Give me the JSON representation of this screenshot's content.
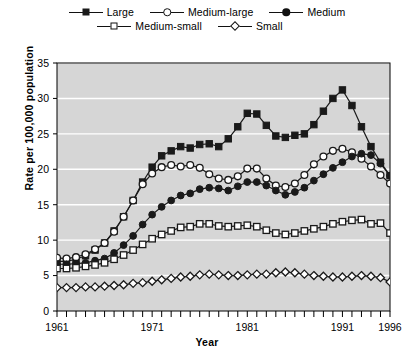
{
  "chart_data": {
    "type": "line",
    "title": "",
    "xlabel": "Year",
    "ylabel": "Rate per 100,000 population",
    "xlim": [
      1961,
      1996
    ],
    "ylim": [
      0,
      35
    ],
    "ytick_step": 5,
    "yticks": [
      0,
      5,
      10,
      15,
      20,
      25,
      30,
      35
    ],
    "xticks": [
      1961,
      1962,
      1963,
      1964,
      1965,
      1966,
      1967,
      1968,
      1969,
      1970,
      1971,
      1972,
      1973,
      1974,
      1975,
      1976,
      1977,
      1978,
      1979,
      1980,
      1981,
      1982,
      1983,
      1984,
      1985,
      1986,
      1987,
      1988,
      1989,
      1990,
      1991,
      1992,
      1993,
      1994,
      1995,
      1996
    ],
    "xtick_labels": [
      "1961",
      "1971",
      "1981",
      "1991",
      "1996"
    ],
    "xtick_label_values": [
      1961,
      1971,
      1981,
      1991,
      1996
    ],
    "grid": "horizontal-white",
    "plot_background": "#d6d6d6",
    "legend_position": "top",
    "x": [
      1961,
      1962,
      1963,
      1964,
      1965,
      1966,
      1967,
      1968,
      1969,
      1970,
      1971,
      1972,
      1973,
      1974,
      1975,
      1976,
      1977,
      1978,
      1979,
      1980,
      1981,
      1982,
      1983,
      1984,
      1985,
      1986,
      1987,
      1988,
      1989,
      1990,
      1991,
      1992,
      1993,
      1994,
      1995,
      1996
    ],
    "series": [
      {
        "name": "Large",
        "marker": "square-filled",
        "color": "#1a1a1a",
        "values": [
          7.0,
          7.0,
          7.3,
          7.8,
          8.6,
          9.6,
          11.3,
          13.3,
          15.6,
          18.2,
          20.3,
          21.9,
          22.6,
          23.2,
          23.0,
          23.5,
          23.6,
          23.2,
          24.3,
          26.0,
          27.9,
          27.8,
          26.2,
          24.7,
          24.5,
          24.8,
          25.0,
          26.3,
          28.2,
          30.0,
          31.2,
          29.0,
          26.0,
          23.2,
          21.0,
          19.1
        ]
      },
      {
        "name": "Medium-large",
        "marker": "circle-open",
        "color": "#1a1a1a",
        "values": [
          7.5,
          7.4,
          7.6,
          8.0,
          8.7,
          9.6,
          11.2,
          13.3,
          15.6,
          17.9,
          19.4,
          20.3,
          20.6,
          20.4,
          20.6,
          20.2,
          19.3,
          18.7,
          18.5,
          19.0,
          20.1,
          20.1,
          18.7,
          17.7,
          17.5,
          18.0,
          19.2,
          20.7,
          21.8,
          22.6,
          22.9,
          22.4,
          21.5,
          20.4,
          19.2,
          18.0
        ]
      },
      {
        "name": "Medium",
        "marker": "circle-filled",
        "color": "#1a1a1a",
        "values": [
          6.6,
          6.6,
          6.7,
          6.8,
          7.1,
          7.4,
          8.2,
          9.3,
          10.6,
          12.2,
          13.6,
          14.7,
          15.6,
          16.3,
          16.6,
          17.2,
          17.4,
          17.3,
          17.0,
          17.6,
          18.2,
          18.2,
          17.7,
          17.0,
          16.4,
          16.8,
          17.4,
          18.4,
          19.3,
          20.2,
          21.0,
          21.8,
          22.2,
          22.0,
          20.8,
          19.1
        ]
      },
      {
        "name": "Medium-small",
        "marker": "square-open",
        "color": "#1a1a1a",
        "values": [
          6.0,
          6.0,
          6.1,
          6.3,
          6.5,
          6.8,
          7.3,
          7.9,
          8.6,
          9.4,
          10.2,
          10.8,
          11.3,
          11.8,
          11.9,
          12.3,
          12.3,
          12.0,
          11.9,
          12.0,
          12.1,
          11.9,
          11.4,
          11.0,
          10.8,
          11.0,
          11.3,
          11.6,
          11.9,
          12.3,
          12.6,
          12.8,
          12.9,
          12.3,
          12.4,
          11.0
        ]
      },
      {
        "name": "Small",
        "marker": "diamond-open",
        "color": "#1a1a1a",
        "values": [
          3.3,
          3.3,
          3.3,
          3.4,
          3.4,
          3.5,
          3.6,
          3.7,
          3.9,
          4.0,
          4.2,
          4.4,
          4.6,
          4.8,
          4.9,
          5.1,
          5.2,
          5.1,
          5.0,
          5.0,
          5.1,
          5.2,
          5.2,
          5.4,
          5.5,
          5.4,
          5.2,
          5.0,
          4.9,
          4.8,
          4.8,
          4.9,
          5.0,
          4.9,
          4.7,
          4.1
        ]
      }
    ]
  },
  "legend": {
    "rows": [
      [
        {
          "label": "Large",
          "marker": "square-filled"
        },
        {
          "label": "Medium-large",
          "marker": "circle-open"
        },
        {
          "label": "Medium",
          "marker": "circle-filled"
        }
      ],
      [
        {
          "label": "Medium-small",
          "marker": "square-open"
        },
        {
          "label": "Small",
          "marker": "diamond-open"
        }
      ]
    ]
  },
  "axes": {
    "y_title": "Rate per 100,000 population",
    "x_title": "Year"
  }
}
